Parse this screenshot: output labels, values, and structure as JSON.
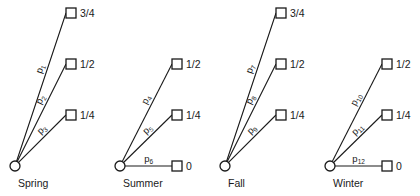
{
  "diagram": {
    "type": "probability-tree",
    "stroke_color": "#1a1a1a",
    "background": "#ffffff",
    "groups": [
      {
        "label": "Spring",
        "root": {
          "x": 15,
          "y": 166
        },
        "branches": [
          {
            "prob": "p",
            "sub": "1",
            "value": "3/4",
            "end": {
              "x": 71,
              "y": 13
            }
          },
          {
            "prob": "p",
            "sub": "2",
            "value": "1/2",
            "end": {
              "x": 71,
              "y": 64
            }
          },
          {
            "prob": "p",
            "sub": "3",
            "value": "1/4",
            "end": {
              "x": 71,
              "y": 115
            }
          }
        ]
      },
      {
        "label": "Summer",
        "root": {
          "x": 120,
          "y": 166
        },
        "branches": [
          {
            "prob": "p",
            "sub": "4",
            "value": "1/2",
            "end": {
              "x": 177,
              "y": 64
            }
          },
          {
            "prob": "p",
            "sub": "5",
            "value": "1/4",
            "end": {
              "x": 177,
              "y": 115
            }
          },
          {
            "prob": "p",
            "sub": "6",
            "value": "0",
            "end": {
              "x": 177,
              "y": 166
            }
          }
        ]
      },
      {
        "label": "Fall",
        "root": {
          "x": 225,
          "y": 166
        },
        "branches": [
          {
            "prob": "p",
            "sub": "7",
            "value": "3/4",
            "end": {
              "x": 281,
              "y": 13
            }
          },
          {
            "prob": "p",
            "sub": "8",
            "value": "1/2",
            "end": {
              "x": 281,
              "y": 64
            }
          },
          {
            "prob": "p",
            "sub": "9",
            "value": "1/4",
            "end": {
              "x": 281,
              "y": 115
            }
          }
        ]
      },
      {
        "label": "Winter",
        "root": {
          "x": 330,
          "y": 166
        },
        "branches": [
          {
            "prob": "p",
            "sub": "10",
            "value": "1/2",
            "end": {
              "x": 387,
              "y": 64
            }
          },
          {
            "prob": "p",
            "sub": "11",
            "value": "1/4",
            "end": {
              "x": 387,
              "y": 115
            }
          },
          {
            "prob": "p",
            "sub": "12",
            "value": "0",
            "end": {
              "x": 387,
              "y": 166
            }
          }
        ]
      }
    ]
  }
}
